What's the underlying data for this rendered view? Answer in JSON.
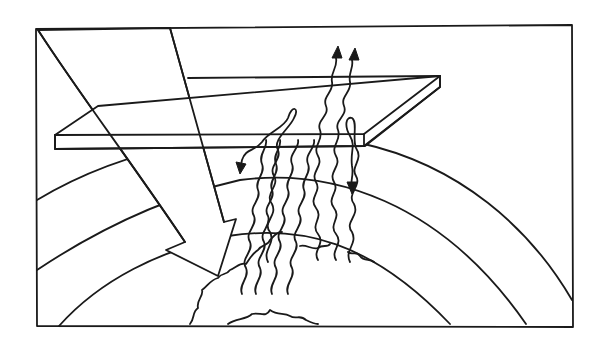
{
  "diagram": {
    "elements": {
      "frame": "border-frame",
      "incoming_arrow": "incoming-solar-radiation-arrow",
      "glass_slab": "atmosphere-glass-slab",
      "layers": [
        "atmosphere-layer-outer",
        "atmosphere-layer-middle",
        "atmosphere-layer-inner"
      ],
      "ground": "earth-surface-terrain",
      "waves_escaping": 2,
      "waves_reflected_down": 2,
      "waves_rising": 4
    },
    "colors": {
      "stroke": "#1a1a1a",
      "background": "#ffffff"
    }
  }
}
